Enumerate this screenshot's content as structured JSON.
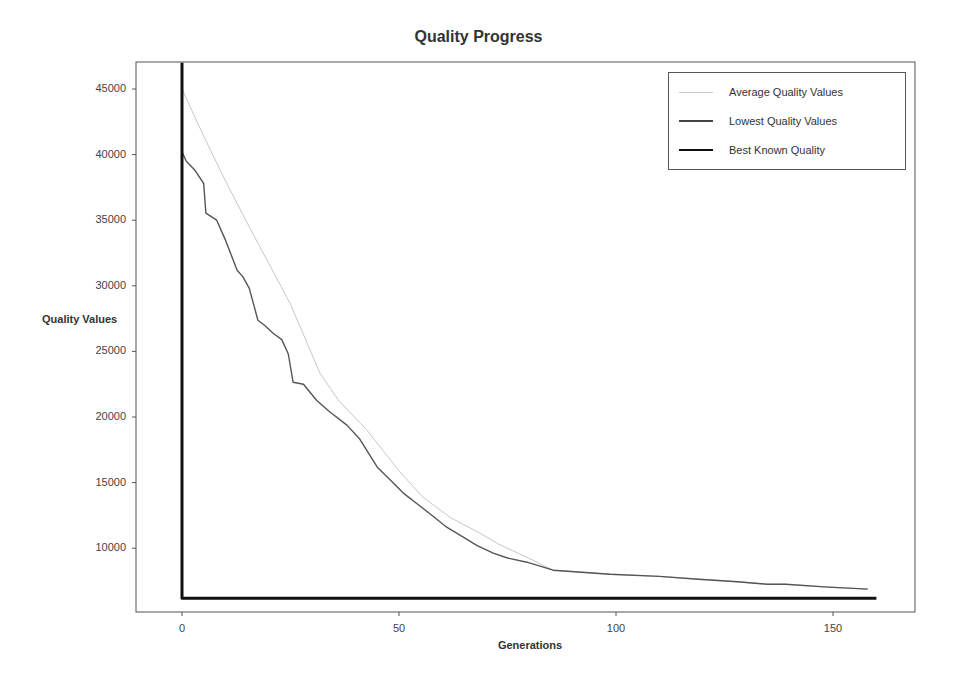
{
  "chart_data": {
    "type": "line",
    "title": "Quality Progress",
    "xlabel": "Generations",
    "ylabel": "Quality Values",
    "xlim": [
      -10.5,
      169
    ],
    "ylim": [
      5050,
      46950
    ],
    "grid": false,
    "legend_position": "upper right",
    "x_ticks": [
      0,
      50,
      100,
      150
    ],
    "y_ticks": [
      10000,
      15000,
      20000,
      25000,
      30000,
      35000,
      40000,
      45000
    ],
    "series": [
      {
        "name": "Average Quality Values",
        "color": "#c8c8c8",
        "style": "thin",
        "x": [
          0,
          5,
          10,
          15,
          20,
          25,
          31.8,
          36,
          42.6,
          50,
          55.5,
          62,
          68.7,
          73,
          79.5,
          85.5,
          98.6,
          110,
          119,
          128,
          134.8,
          139,
          148,
          158
        ],
        "y": [
          45000,
          41400,
          38000,
          34800,
          31700,
          28600,
          23340,
          21300,
          19000,
          15900,
          13890,
          12300,
          11140,
          10300,
          9310,
          8320,
          8020,
          7850,
          7640,
          7450,
          7256,
          7256,
          7050,
          6880
        ]
      },
      {
        "name": "Lowest Quality Values",
        "color": "#555555",
        "style": "solid",
        "x": [
          0,
          1,
          3,
          5,
          5.5,
          8,
          10,
          12.7,
          14,
          15.5,
          17.5,
          19,
          21,
          23,
          24.5,
          25.6,
          28,
          31,
          34,
          38,
          41,
          45,
          48,
          51,
          54,
          58,
          61,
          65,
          68,
          71.7,
          75,
          79.5,
          85.5,
          98.6,
          110,
          119,
          128,
          134.8,
          139,
          148,
          158
        ],
        "y": [
          40200,
          39500,
          38800,
          37800,
          35530,
          35000,
          33500,
          31190,
          30700,
          29800,
          27380,
          27000,
          26390,
          25900,
          24800,
          22650,
          22500,
          21280,
          20400,
          19380,
          18300,
          16170,
          15200,
          14200,
          13430,
          12400,
          11600,
          10800,
          10200,
          9620,
          9250,
          8930,
          8320,
          8020,
          7850,
          7640,
          7450,
          7256,
          7256,
          7050,
          6880
        ]
      },
      {
        "name": "Best Known Quality",
        "color": "#111111",
        "style": "thick",
        "x": [
          0,
          0,
          160
        ],
        "y": [
          47000,
          6190,
          6190
        ]
      }
    ]
  },
  "page": {
    "title": "Quality Progress",
    "xlabel": "Generations",
    "ylabel": "Quality Values",
    "y_tick_labels": [
      "45000",
      "40000",
      "35000",
      "30000",
      "25000",
      "20000",
      "15000",
      "10000"
    ],
    "x_tick_labels": [
      "0",
      "50",
      "100",
      "150"
    ],
    "legend": [
      {
        "label": "Average Quality Values",
        "color": "#c8c8c8"
      },
      {
        "label": "Lowest Quality Values",
        "color": "#444444"
      },
      {
        "label": "Best Known Quality",
        "color": "#111111"
      }
    ]
  }
}
